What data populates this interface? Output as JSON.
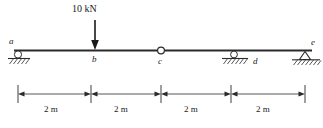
{
  "figure": {
    "type": "beam-free-body-diagram",
    "load": {
      "label": "10 kN",
      "magnitude": 10,
      "unit": "kN",
      "direction": "down",
      "applied_at": "b"
    },
    "nodes": [
      {
        "id": "a",
        "label": "a",
        "kind": "roller-support",
        "station_m": 0
      },
      {
        "id": "b",
        "label": "b",
        "kind": "load-point",
        "station_m": 2
      },
      {
        "id": "c",
        "label": "c",
        "kind": "internal-hinge",
        "station_m": 4
      },
      {
        "id": "d",
        "label": "d",
        "kind": "roller-support",
        "station_m": 6
      },
      {
        "id": "e",
        "label": "e",
        "kind": "pin-support",
        "station_m": 8
      }
    ],
    "dimensions": [
      {
        "label": "2 m",
        "value": 2,
        "unit": "m",
        "from": "a",
        "to": "b"
      },
      {
        "label": "2 m",
        "value": 2,
        "unit": "m",
        "from": "b",
        "to": "c"
      },
      {
        "label": "2 m",
        "value": 2,
        "unit": "m",
        "from": "c",
        "to": "d"
      },
      {
        "label": "2 m",
        "value": 2,
        "unit": "m",
        "from": "d",
        "to": "e"
      }
    ],
    "total_span": {
      "value": 8,
      "unit": "m"
    },
    "colors": {
      "ink": "#2b2b2b",
      "text": "#1a1a1a",
      "background": "#ffffff"
    }
  }
}
